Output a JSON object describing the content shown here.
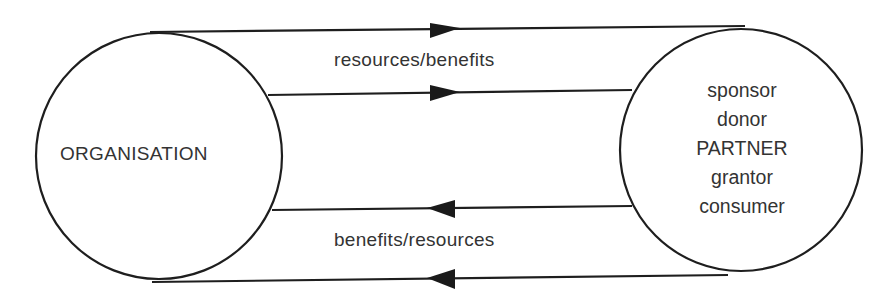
{
  "diagram": {
    "nodes": {
      "organisation": {
        "label": "ORGANISATION"
      },
      "partner": {
        "labels": [
          "sponsor",
          "donor",
          "PARTNER",
          "grantor",
          "consumer"
        ]
      }
    },
    "flows": {
      "outgoing": {
        "label": "resources/benefits",
        "direction": "organisation-to-partner"
      },
      "incoming": {
        "label": "benefits/resources",
        "direction": "partner-to-organisation"
      }
    },
    "colors": {
      "ink": "#1e1e1e",
      "text": "#333333",
      "background": "#ffffff"
    }
  }
}
